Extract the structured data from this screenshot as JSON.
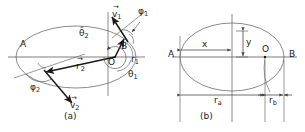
{
  "figure": {
    "type": "two-panel-geometry-diagram",
    "panels": [
      {
        "id": "a",
        "caption": "(a)",
        "description": "Ellipse with two position vectors r1 and r2 drawn from focus O to points on the ellipse, velocity vectors v1 and v2 tangent to the ellipse, true anomaly angles theta1 and theta2 measured at the focus, and flight-path angles phi1 and phi2 between the local horizon and the velocity vectors.",
        "labels": {
          "apoapsis": "A",
          "periapsis": "B",
          "focus": "O",
          "radius_1": "r",
          "radius_1_sub": "1",
          "radius_2": "r",
          "radius_2_sub": "2",
          "velocity_1": "v",
          "velocity_1_sub": "1",
          "velocity_2": "v",
          "velocity_2_sub": "2",
          "theta_1": "θ",
          "theta_1_sub": "1",
          "theta_2": "θ̂",
          "theta_2_sub": "2",
          "phi_1": "φ",
          "phi_1_sub": "1",
          "phi_2": "φ",
          "phi_2_sub": "2"
        }
      },
      {
        "id": "b",
        "caption": "(b)",
        "description": "Same ellipse annotated with cartesian offsets x and y from the ellipse centre to a point, and the apoapsis radius r_a and periapsis radius r_b measured along the major axis from the focus O.",
        "labels": {
          "apoapsis": "A",
          "periapsis": "B",
          "focus": "O",
          "x_offset": "x",
          "y_offset": "y",
          "radius_apoapsis": "r",
          "radius_apoapsis_sub": "a",
          "radius_periapsis": "r",
          "radius_periapsis_sub": "b"
        }
      }
    ],
    "colors": {
      "curve": "#6d6d6d",
      "axis": "#5a5a5a",
      "vector": "#1a1a1a",
      "dimension": "#4a4a4a",
      "text": "#1a1a1a",
      "background": "#ffffff"
    }
  }
}
